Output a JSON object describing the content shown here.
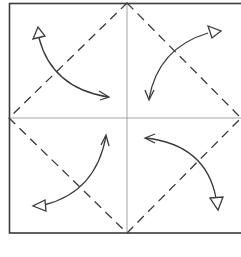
{
  "diagram": {
    "type": "origami-fold-diagram",
    "colors": {
      "line": "#3a3a3a",
      "crease": "#9a9a9a",
      "background": "#ffffff"
    },
    "square": {
      "x": 9,
      "y": 3,
      "width": 236,
      "height": 230
    },
    "center": {
      "x": 127,
      "y": 118
    },
    "crease_lines": [
      "vertical-center",
      "horizontal-center"
    ],
    "valley_fold_diamond": {
      "style": "dashed",
      "vertices": [
        [
          127,
          3
        ],
        [
          241,
          118
        ],
        [
          127,
          233
        ],
        [
          9,
          118
        ]
      ]
    },
    "arrows": [
      {
        "id": "top-left",
        "from_corner": "top-left",
        "to": "center"
      },
      {
        "id": "top-right",
        "from_corner": "top-right",
        "to": "center"
      },
      {
        "id": "bottom-left",
        "from_corner": "bottom-left",
        "to": "center"
      },
      {
        "id": "bottom-right",
        "from_corner": "bottom-right",
        "to": "center"
      }
    ]
  }
}
